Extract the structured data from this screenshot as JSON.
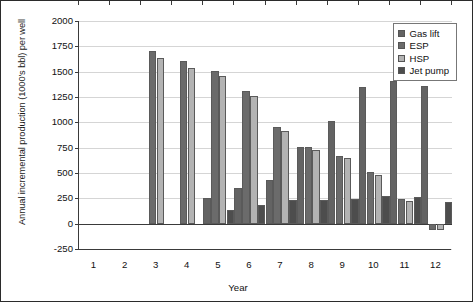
{
  "chart_data": {
    "type": "bar",
    "title": "",
    "xlabel": "Year",
    "ylabel": "Annual incremental production (1000's bbl) per well",
    "categories": [
      "1",
      "2",
      "3",
      "4",
      "5",
      "6",
      "7",
      "8",
      "9",
      "10",
      "11",
      "12"
    ],
    "ylim": [
      -250,
      2000
    ],
    "ytick_step": 250,
    "yticks": [
      "2000",
      "1750",
      "1500",
      "1250",
      "1000",
      "750",
      "500",
      "250",
      "0",
      "-250"
    ],
    "grid": true,
    "legend_position": "top-right",
    "series": [
      {
        "name": "Gas lift",
        "color": "#636363",
        "values": [
          null,
          null,
          null,
          null,
          255,
          350,
          430,
          760,
          1010,
          1350,
          1410,
          1360
        ]
      },
      {
        "name": "ESP",
        "color": "#6b6b6b",
        "values": [
          null,
          null,
          1700,
          1605,
          1510,
          1310,
          955,
          755,
          670,
          505,
          240,
          -60
        ]
      },
      {
        "name": "HSP",
        "color": "#b3b3b3",
        "values": [
          null,
          null,
          1635,
          1540,
          1455,
          1260,
          915,
          730,
          645,
          485,
          220,
          -60
        ]
      },
      {
        "name": "Jet pump",
        "color": "#4d4d4d",
        "values": [
          null,
          null,
          null,
          null,
          130,
          185,
          235,
          238,
          245,
          275,
          260,
          210
        ]
      }
    ]
  }
}
